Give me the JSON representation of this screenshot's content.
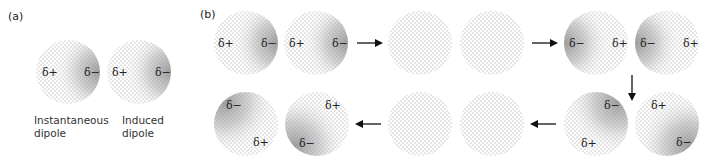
{
  "panels": {
    "a": {
      "label": "(a)",
      "atoms": [
        {
          "caption_line1": "Instantaneous",
          "caption_line2": "dipole",
          "state": "dipole",
          "negative_side": "right",
          "charges": {
            "positive": "δ+",
            "negative": "δ−"
          }
        },
        {
          "caption_line1": "Induced",
          "caption_line2": "dipole",
          "state": "dipole",
          "negative_side": "right",
          "charges": {
            "positive": "δ+",
            "negative": "δ−"
          }
        }
      ]
    },
    "b": {
      "label": "(b)",
      "sequence": [
        {
          "step": 1,
          "state": "dipole",
          "negative_side": "right",
          "charges": {
            "positive": "δ+",
            "negative": "δ−"
          }
        },
        {
          "step": 2,
          "state": "uniform"
        },
        {
          "step": 3,
          "state": "dipole",
          "negative_side": "left",
          "charges": {
            "positive": "δ+",
            "negative": "δ−"
          }
        },
        {
          "step": 4,
          "state": "dipole",
          "negative_side": "diagonal",
          "charges": {
            "positive": "δ+",
            "negative": "δ−"
          }
        },
        {
          "step": 5,
          "state": "uniform"
        },
        {
          "step": 6,
          "state": "dipole",
          "negative_side": "diagonal",
          "charges": {
            "positive": "δ+",
            "negative": "δ−"
          }
        }
      ],
      "arrows": [
        "right",
        "right",
        "down",
        "left",
        "left"
      ]
    }
  },
  "colors": {
    "dots": "#8a8a8a",
    "shade": "#9a9a9a",
    "arrow": "#111111",
    "text": "#222222"
  }
}
